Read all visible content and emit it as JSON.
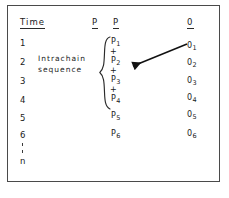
{
  "figure": {
    "background_color": "#ffffff",
    "ink_color": "#1a1a1a",
    "frame_color": "#4a4a4a"
  },
  "headers": {
    "time": "Time",
    "p_left": "P",
    "p_right": "P",
    "o": "0"
  },
  "time_column": {
    "values": [
      "1",
      "2",
      "3",
      "4",
      "5",
      "6"
    ],
    "ellipsis": "⋮",
    "last": "n"
  },
  "annotation": {
    "line1": "Intrachain",
    "line2": "sequence"
  },
  "p_column": {
    "items": [
      {
        "kind": "term",
        "base": "P",
        "sub": "1"
      },
      {
        "kind": "operator",
        "text": "+"
      },
      {
        "kind": "term",
        "base": "P",
        "sub": "2"
      },
      {
        "kind": "operator",
        "text": "+"
      },
      {
        "kind": "term",
        "base": "P",
        "sub": "3"
      },
      {
        "kind": "operator",
        "text": "+"
      },
      {
        "kind": "term",
        "base": "P",
        "sub": "4"
      },
      {
        "kind": "term",
        "base": "P",
        "sub": "5"
      },
      {
        "kind": "term",
        "base": "P",
        "sub": "6"
      }
    ],
    "brace_spans": "P1 through P4"
  },
  "o_column": {
    "items": [
      {
        "base": "0",
        "sub": "1"
      },
      {
        "base": "0",
        "sub": "2"
      },
      {
        "base": "0",
        "sub": "3"
      },
      {
        "base": "0",
        "sub": "4"
      },
      {
        "base": "0",
        "sub": "5"
      },
      {
        "base": "0",
        "sub": "6"
      }
    ]
  },
  "arrow": {
    "from": "0 sub 1",
    "to": "P sub 2 region",
    "direction": "right-to-left, downward"
  }
}
